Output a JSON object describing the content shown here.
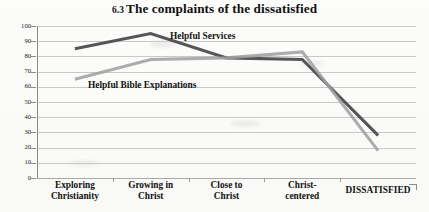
{
  "title": {
    "number": "6.3",
    "text": "The complaints of the dissatisfied",
    "full": "6.3  The complaints of the dissatisfied"
  },
  "colors": {
    "series_dark": "#4d4d4d",
    "series_light": "#a0a0a0",
    "gridline": "#c9c9c9",
    "axis": "#8a8a8a",
    "text": "#111111",
    "background": "#ffffff"
  },
  "edge_mark": "corner-bracket",
  "chart_data": {
    "type": "line",
    "xlabel": "",
    "ylabel": "",
    "ylim": [
      0,
      100
    ],
    "ytick_step": 10,
    "yticks": [
      0,
      10,
      20,
      30,
      40,
      50,
      60,
      70,
      80,
      90,
      100
    ],
    "ytick_labels": [
      "0",
      "10",
      "20",
      "30",
      "40",
      "50",
      "60",
      "70",
      "80",
      "90",
      "100"
    ],
    "grid": true,
    "grid_axis": "y",
    "legend": "inline-labels",
    "legend_position": "on-plot",
    "categories": [
      "Exploring Christianity",
      "Growing in Christ",
      "Close to Christ",
      "Christ-centered",
      "DISSATISFIED"
    ],
    "category_lines": [
      [
        "Exploring",
        "Christianity"
      ],
      [
        "Growing in",
        "Christ"
      ],
      [
        "Close to",
        "Christ"
      ],
      [
        "Christ-",
        "centered"
      ],
      [
        "DISSATISFIED",
        ""
      ]
    ],
    "series": [
      {
        "name": "Helpful Services",
        "color": "#4d4d4d",
        "values": [
          85,
          95,
          79,
          78,
          28
        ]
      },
      {
        "name": "Helpful Bible Explanations",
        "color": "#a0a0a0",
        "values": [
          65,
          78,
          79,
          83,
          18
        ]
      }
    ]
  }
}
